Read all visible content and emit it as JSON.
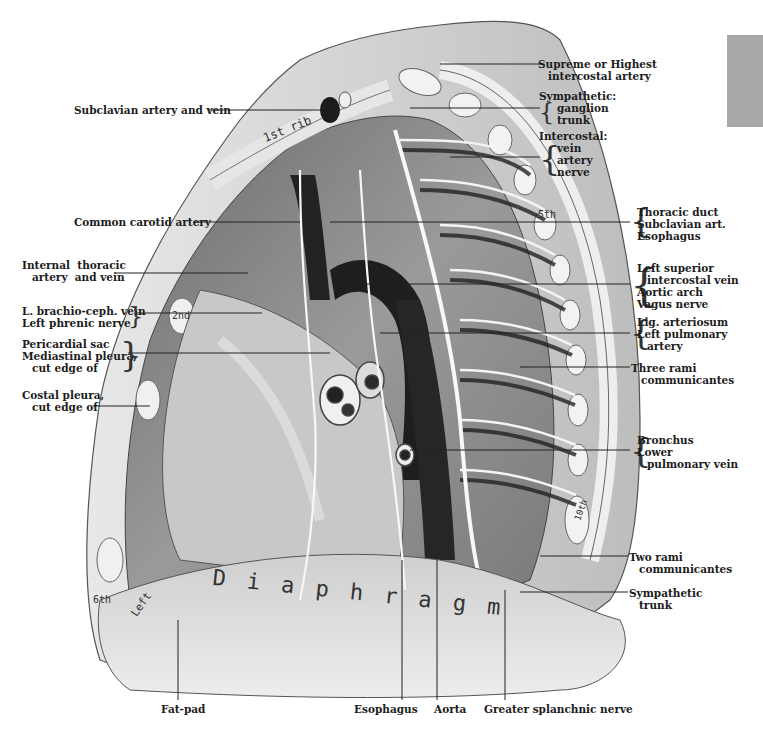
{
  "figure": {
    "tab_color": "#a8a8a8"
  },
  "labels_left": {
    "subclavian": "Subclavian artery and vein",
    "common_carotid": "Common carotid artery",
    "internal_thoracic_1": "Internal  thoracic",
    "internal_thoracic_2": "artery  and vein",
    "brachio_1": "L. brachio-ceph. vein",
    "brachio_2": "Left phrenic nerve",
    "pericardial_1": "Pericardial sac",
    "pericardial_2": "Mediastinal pleura,",
    "pericardial_3": "cut edge of",
    "costal_1": "Costal pleura,",
    "costal_2": "cut edge of"
  },
  "labels_right": {
    "supreme_1": "Supreme or Highest",
    "supreme_2": "intercostal artery",
    "sympathetic_h": "Sympathetic:",
    "sympathetic_1": "ganglion",
    "sympathetic_2": "trunk",
    "intercostal_h": "Intercostal:",
    "intercostal_1": "vein",
    "intercostal_2": "artery",
    "intercostal_3": "nerve",
    "thoracic_1": "Thoracic duct",
    "thoracic_2": "Subclavian art.",
    "thoracic_3": "Esophagus",
    "lsiv_1": "Left superior",
    "lsiv_2": "intercostal vein",
    "lsiv_3": "Aortic arch",
    "lsiv_4": "Vagus nerve",
    "lig_1": "Lig. arteriosum",
    "lig_2": "Left pulmonary",
    "lig_3": "artery",
    "three_rami_1": "Three rami",
    "three_rami_2": "communicantes",
    "bronchus_1": "Bronchus",
    "bronchus_2": "Lower",
    "bronchus_3": "pulmonary vein",
    "two_rami_1": "Two rami",
    "two_rami_2": "communicantes",
    "symp_trunk_1": "Sympathetic",
    "symp_trunk_2": "trunk"
  },
  "labels_bottom": {
    "fat_pad": "Fat-pad",
    "esophagus": "Esophagus",
    "aorta": "Aorta",
    "splanchnic": "Greater splanchnic nerve"
  },
  "in_image_text": {
    "rib_1": "1st  rib",
    "rib_2": "2nd",
    "rib_5": "5th",
    "rib_6": "6th",
    "rib_10": "10th",
    "diaphragm": "D i a p h r a g m",
    "left_lower": "Left"
  }
}
